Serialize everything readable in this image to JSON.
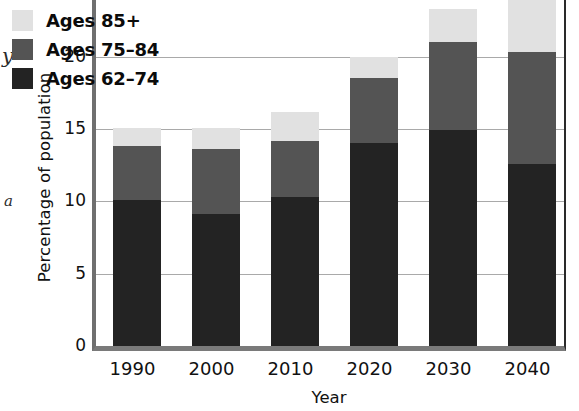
{
  "chart_data": {
    "type": "bar",
    "subtype": "stacked-bar",
    "title": "",
    "xlabel": "Year",
    "ylabel": "Percentage of population",
    "categories": [
      "1990",
      "2000",
      "2010",
      "2020",
      "2030",
      "2040"
    ],
    "series": [
      {
        "name": "Ages 62–74",
        "color": "#232323",
        "values": [
          10.1,
          9.1,
          10.3,
          14.0,
          14.9,
          12.6
        ]
      },
      {
        "name": "Ages 75–84",
        "color": "#545454",
        "values": [
          3.7,
          4.5,
          3.9,
          4.5,
          6.1,
          7.7
        ]
      },
      {
        "name": "Ages 85+",
        "color": "#e1e1e1",
        "values": [
          1.3,
          1.5,
          2.0,
          1.5,
          2.3,
          3.7
        ]
      }
    ],
    "totals": [
      15.1,
      15.1,
      16.2,
      20.0,
      23.3,
      24.0
    ],
    "ylim": [
      0,
      25
    ],
    "yticks": [
      0,
      5,
      10,
      15,
      20,
      25
    ],
    "ytick_labels": [
      "0",
      "5",
      "10",
      "15",
      "20",
      "25"
    ],
    "grid": "horizontal",
    "legend_position": "top-left",
    "note": "top of plot is cropped just above the 25 tick"
  },
  "axes": {
    "y_title": "Percentage of population",
    "x_title": "Year",
    "y_ticks": [
      {
        "value": 25,
        "label": "25"
      },
      {
        "value": 20,
        "label": "20"
      },
      {
        "value": 15,
        "label": "15"
      },
      {
        "value": 10,
        "label": "10"
      },
      {
        "value": 5,
        "label": "5"
      },
      {
        "value": 0,
        "label": "0"
      }
    ],
    "x_ticks": [
      {
        "label": "1990"
      },
      {
        "label": "2000"
      },
      {
        "label": "2010"
      },
      {
        "label": "2020"
      },
      {
        "label": "2030"
      },
      {
        "label": "2040"
      }
    ]
  },
  "legend": {
    "items": [
      {
        "label": "Ages 85+",
        "color": "#e1e1e1"
      },
      {
        "label": "Ages 75–84",
        "color": "#545454"
      },
      {
        "label": "Ages 62–74",
        "color": "#232323"
      }
    ]
  },
  "artifacts": {
    "stray_y": "y",
    "stray_a": "a"
  },
  "colors": {
    "light": "#e1e1e1",
    "mid": "#545454",
    "dark": "#232323",
    "gridline": "#a9a9a9",
    "axis": "#2a2a2a",
    "text": "#111111",
    "background": "#ffffff"
  }
}
